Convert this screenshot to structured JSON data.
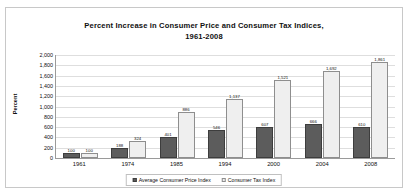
{
  "chart_data": {
    "type": "bar",
    "title": "Percent Increase in Consumer Price and Consumer Tax Indices, 1961-2008",
    "title_line1": "Percent Increase in Consumer Price and Consumer Tax Indices,",
    "title_line2": "1961-2008",
    "xlabel": "",
    "ylabel": "Percent",
    "ylim": [
      0,
      2000
    ],
    "ytick_step": 200,
    "ytick_labels": [
      "2,000",
      "1,800",
      "1,600",
      "1,400",
      "1,200",
      "1,000",
      "800",
      "600",
      "400",
      "200",
      "0"
    ],
    "grid": true,
    "legend_position": "bottom",
    "categories": [
      "1961",
      "1974",
      "1985",
      "1994",
      "2000",
      "2004",
      "2008"
    ],
    "series": [
      {
        "name": "Average Consumer Price Index",
        "color": "#5c5c5c",
        "values": [
          100,
          188,
          401,
          546,
          607,
          666,
          610
        ],
        "value_labels": [
          "100",
          "188",
          "401",
          "546",
          "607",
          "666",
          "610"
        ]
      },
      {
        "name": "Consumer Tax Index",
        "color": "#efefef",
        "values": [
          100,
          324,
          886,
          1137,
          1521,
          1692,
          1861
        ],
        "value_labels": [
          "100",
          "324",
          "886",
          "1,137",
          "1,521",
          "1,692",
          "1,861"
        ]
      }
    ]
  }
}
